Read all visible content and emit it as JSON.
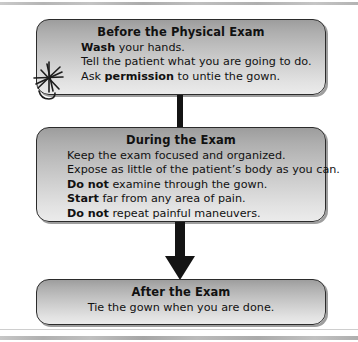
{
  "diagram": {
    "accent_color": "#141414",
    "box_fill_top": "#9d9d9d",
    "box_fill_bottom": "#ebebeb",
    "boxes": [
      {
        "id": "before",
        "title": "Before the Physical Exam",
        "lines": [
          {
            "bold": "Wash",
            "rest": " your hands."
          },
          {
            "bold": "",
            "rest": "Tell the patient what you are going to do."
          },
          {
            "bold": "",
            "rest": "Ask ",
            "bold2": "permission",
            "rest2": " to untie the gown."
          }
        ]
      },
      {
        "id": "during",
        "title": "During the Exam",
        "lines": [
          {
            "bold": "",
            "rest": "Keep the exam focused and organized."
          },
          {
            "bold": "",
            "rest": "Expose as little of the patient’s body as you can."
          },
          {
            "bold": "Do not",
            "rest": " examine through the gown."
          },
          {
            "bold": "Start",
            "rest": " far from any area of pain."
          },
          {
            "bold": "Do not",
            "rest": " repeat painful maneuvers."
          }
        ]
      },
      {
        "id": "after",
        "title": "After the Exam",
        "lines": [
          {
            "bold": "",
            "rest": "Tie the gown when you are done."
          }
        ]
      }
    ],
    "connectors": [
      {
        "id": "bar",
        "from": "before",
        "to": "during",
        "style": "bar"
      },
      {
        "id": "arrow",
        "from": "during",
        "to": "after",
        "style": "arrow-down"
      }
    ],
    "annotations": [
      {
        "id": "pen-star",
        "kind": "handwritten-star-mark",
        "color": "#1d1d1d"
      }
    ]
  }
}
